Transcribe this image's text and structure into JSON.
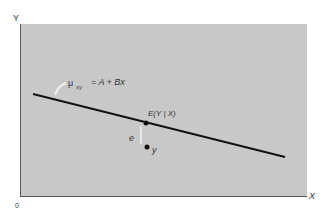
{
  "diagram": {
    "axes": {
      "y_label": "Y",
      "x_label": "X",
      "origin_label": "0"
    },
    "regression_line": {
      "label_mu": "μ",
      "label_sub": "xy",
      "label_eq": "= A + Bx"
    },
    "point_on_line": {
      "label": "E(Y | X)"
    },
    "error": {
      "label": "e"
    },
    "observation": {
      "label": "y"
    },
    "colors": {
      "plot_background": "#c8c8c8",
      "line": "#111111",
      "axis": "#555555",
      "arrow": "#f2f2f2"
    }
  }
}
